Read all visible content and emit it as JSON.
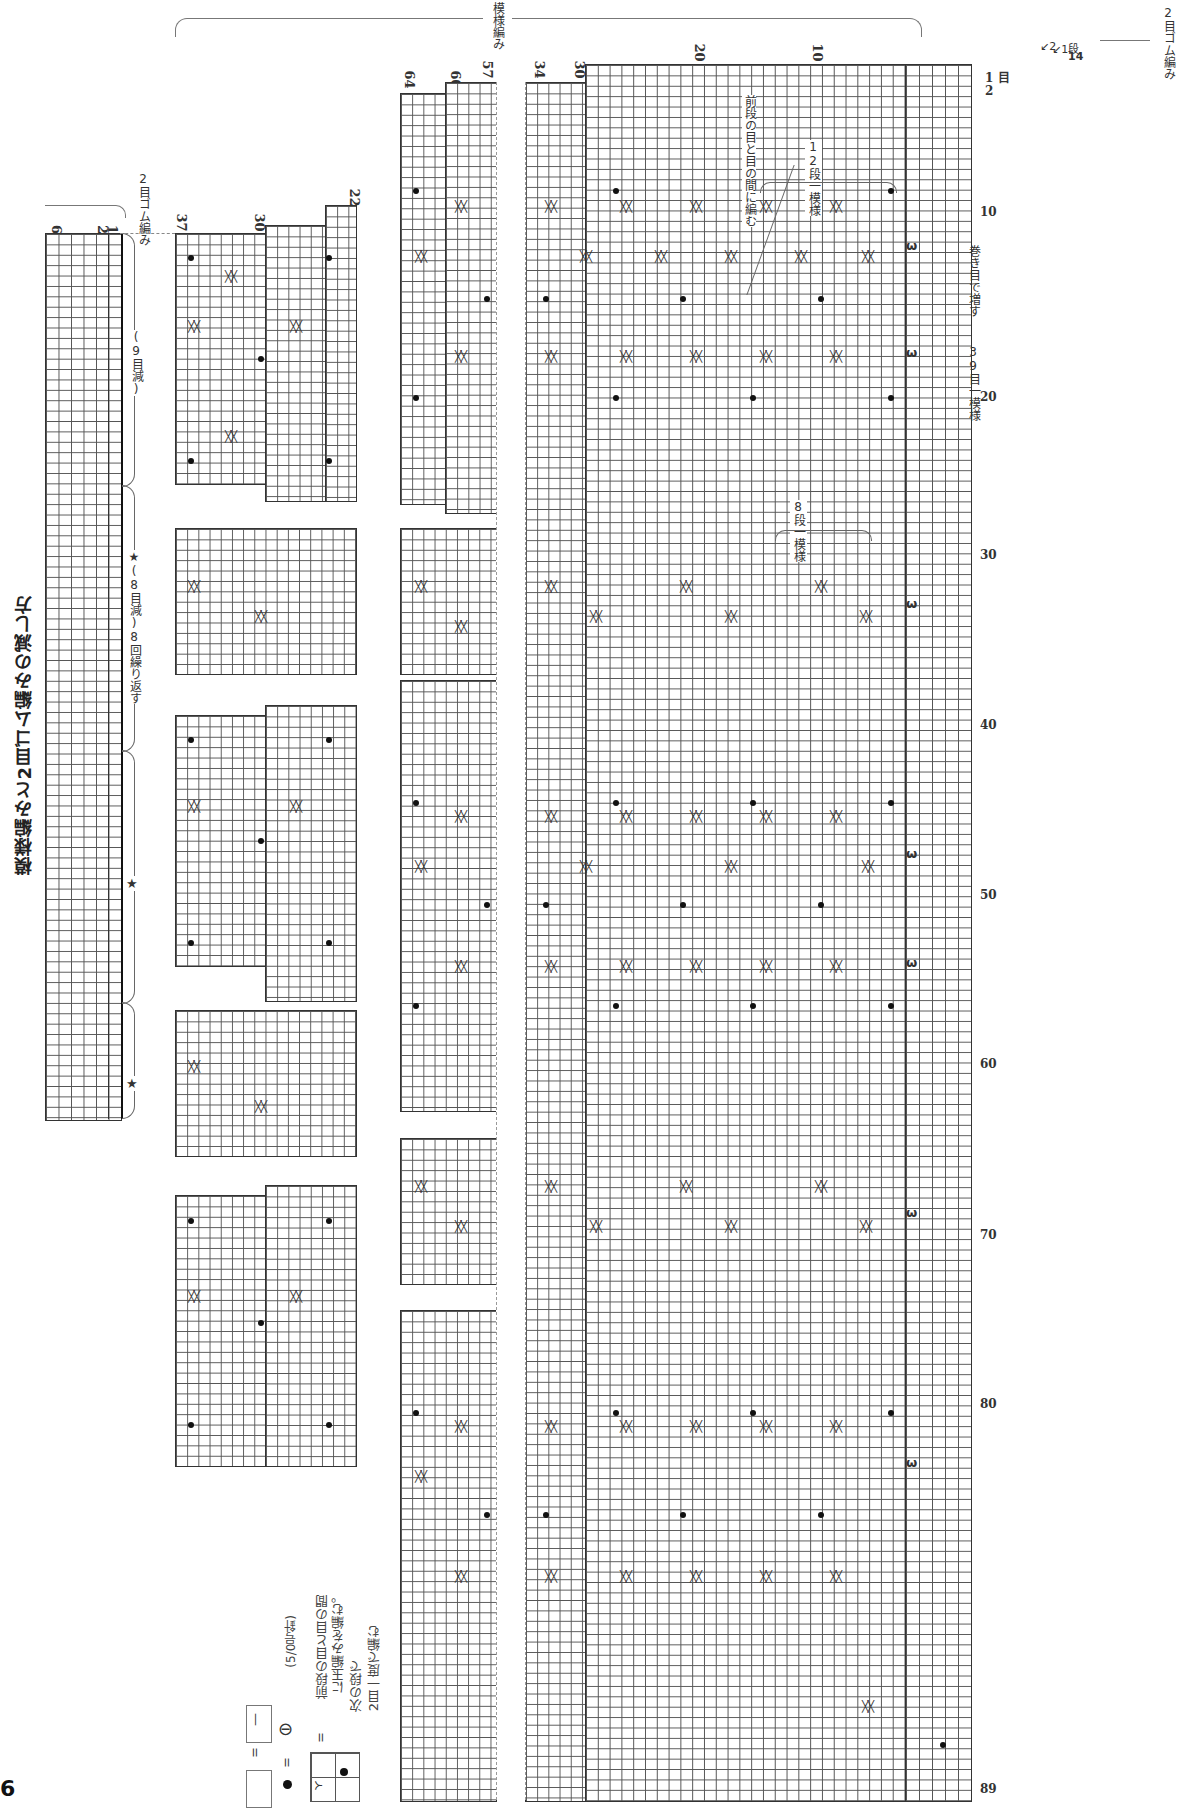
{
  "page": {
    "number": "6",
    "title": "模様編みと2目ゴム編みの減し方"
  },
  "labels": {
    "pattern_knit": "模様編み",
    "rib_top": "2目ゴム編み",
    "rib_left": "2目ゴム編み",
    "nine_dec": "(9目減)",
    "eight_dec_repeat": "★(8目減)8回繰り返す",
    "star": "★",
    "between_stitches": "前段の目と目の間に編む",
    "twelve_row_repeat": "12段一模様",
    "eight_row_repeat": "8段一模様",
    "cast_on_increase": "巻き目で増す",
    "stitch_repeat": "39目一模様",
    "row_unit": "段",
    "stitch_unit": "目"
  },
  "row_numbers": {
    "main_top": [
      "34",
      "30",
      "20",
      "10",
      "2",
      "1",
      "14"
    ],
    "mid_top": [
      "64",
      "60",
      "57"
    ],
    "left_top": [
      "37",
      "30",
      "22"
    ],
    "rib_rows": [
      "6",
      "2",
      "1"
    ],
    "bottom": "89"
  },
  "stitch_numbers": [
    "1",
    "2",
    "10",
    "20",
    "30",
    "40",
    "50",
    "60",
    "70",
    "80",
    "89"
  ],
  "legend": {
    "blank_equals": "=",
    "purl_symbol": "—",
    "bobble_equals": "=",
    "bobble_needle": "(5/0号針)",
    "bobble_desc_1": "前段の目と目の間",
    "bobble_desc_2": "に玉編みを編む。",
    "bobble_desc_3": "次の段で",
    "bobble_desc_4": "2目一度で編む",
    "equals": "="
  }
}
